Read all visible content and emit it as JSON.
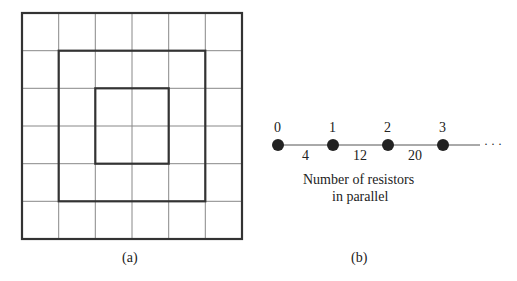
{
  "panel_a": {
    "caption": "(a)",
    "grid": {
      "rows": 6,
      "cols": 6
    },
    "squares": [
      "outer 6x6",
      "middle 4x4",
      "inner 2x2"
    ]
  },
  "panel_b": {
    "caption": "(b)",
    "nodes": [
      "0",
      "1",
      "2",
      "3"
    ],
    "edges": [
      "4",
      "12",
      "20"
    ],
    "ellipsis": "· · ·",
    "description_line1": "Number of resistors",
    "description_line2": "in parallel"
  }
}
